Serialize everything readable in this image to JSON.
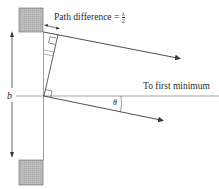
{
  "diagram": {
    "labels": {
      "path_difference": "Path difference =",
      "lambda": "λ",
      "two": "2",
      "to_first_minimum": "To first minimum",
      "slit_width": "b",
      "angle": "θ"
    },
    "colors": {
      "line": "#3a3a3a",
      "block_fill": "#b8b8b8",
      "block_stroke": "#555555",
      "text": "#2a2a2a"
    }
  }
}
